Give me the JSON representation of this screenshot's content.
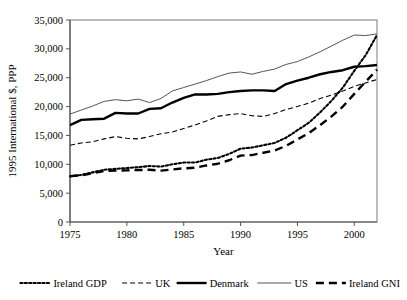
{
  "chart_data": {
    "type": "line",
    "title": "",
    "xlabel": "Year",
    "ylabel": "1995 International $, PPP",
    "xlim": [
      1975,
      2002
    ],
    "ylim": [
      0,
      35000
    ],
    "grid": false,
    "legend_position": "bottom",
    "xticks": [
      "1975",
      "1980",
      "1985",
      "1990",
      "1995",
      "2000"
    ],
    "xtick_values": [
      1975,
      1980,
      1985,
      1990,
      1995,
      2000
    ],
    "yticks": [
      "0",
      "5,000",
      "10,000",
      "15,000",
      "20,000",
      "25,000",
      "30,000",
      "35,000"
    ],
    "ytick_values": [
      0,
      5000,
      10000,
      15000,
      20000,
      25000,
      30000,
      35000
    ],
    "x": [
      1975,
      1976,
      1977,
      1978,
      1979,
      1980,
      1981,
      1982,
      1983,
      1984,
      1985,
      1986,
      1987,
      1988,
      1989,
      1990,
      1991,
      1992,
      1993,
      1994,
      1995,
      1996,
      1997,
      1998,
      1999,
      2000,
      2001,
      2002
    ],
    "series": [
      {
        "name": "Ireland GDP",
        "style": "dotted",
        "width": 2.1,
        "color": "#000000",
        "values": [
          7900,
          8150,
          8600,
          9050,
          9200,
          9350,
          9500,
          9700,
          9600,
          10000,
          10300,
          10300,
          10800,
          11100,
          11800,
          12700,
          12900,
          13300,
          13700,
          14600,
          15900,
          17200,
          19000,
          21000,
          23300,
          26200,
          28900,
          32400
        ]
      },
      {
        "name": "UK",
        "style": "dashed-thin",
        "width": 1.1,
        "color": "#000000",
        "values": [
          13300,
          13700,
          13900,
          14400,
          14800,
          14500,
          14400,
          14800,
          15300,
          15600,
          16200,
          16800,
          17500,
          18300,
          18600,
          18800,
          18400,
          18300,
          18800,
          19500,
          20000,
          20600,
          21400,
          22000,
          22700,
          23500,
          24100,
          24700
        ]
      },
      {
        "name": "Denmark",
        "style": "solid-thick",
        "width": 2.4,
        "color": "#000000",
        "values": [
          16800,
          17700,
          17800,
          17900,
          18900,
          18800,
          18800,
          19600,
          19700,
          20700,
          21500,
          22100,
          22100,
          22200,
          22500,
          22700,
          22800,
          22800,
          22700,
          23900,
          24500,
          25000,
          25600,
          26000,
          26300,
          26900,
          27000,
          27200
        ]
      },
      {
        "name": "US",
        "style": "solid-thin",
        "width": 1.0,
        "color": "#555555",
        "values": [
          18700,
          19400,
          20100,
          20900,
          21200,
          21000,
          21300,
          20700,
          21400,
          22700,
          23300,
          23900,
          24500,
          25200,
          25800,
          26000,
          25600,
          26100,
          26500,
          27300,
          27800,
          28600,
          29500,
          30500,
          31500,
          32400,
          32300,
          32600
        ]
      },
      {
        "name": "Ireland GNI",
        "style": "dashed-thick",
        "width": 2.4,
        "color": "#000000",
        "values": [
          7950,
          8100,
          8450,
          8850,
          8900,
          8950,
          9000,
          9050,
          8900,
          9100,
          9300,
          9400,
          9800,
          10100,
          10700,
          11500,
          11600,
          12000,
          12400,
          13200,
          14300,
          15400,
          16800,
          18300,
          20000,
          22200,
          24300,
          26400
        ]
      }
    ]
  },
  "legend": {
    "items": [
      {
        "label": "Ireland GDP",
        "style": "dotted"
      },
      {
        "label": "UK",
        "style": "dashed-thin"
      },
      {
        "label": "Denmark",
        "style": "solid-thick"
      },
      {
        "label": "US",
        "style": "solid-thin"
      },
      {
        "label": "Ireland GNI",
        "style": "dashed-thick"
      }
    ]
  }
}
